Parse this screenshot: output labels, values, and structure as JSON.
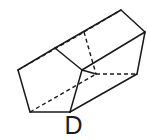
{
  "figure": {
    "label": "D",
    "shape_name": "pentagonal-prism",
    "projection": "oblique",
    "line_color": "#1a1a1a",
    "fill_color": "#ffffff",
    "background_color": "#ffffff",
    "geometry": {
      "front_pentagon": [
        [
          18,
          70
        ],
        [
          55,
          48
        ],
        [
          82,
          70
        ],
        [
          70,
          112
        ],
        [
          30,
          112
        ]
      ],
      "back_pentagon": [
        [
          84,
          32
        ],
        [
          121,
          10
        ],
        [
          145,
          32
        ],
        [
          137,
          74
        ],
        [
          96,
          74
        ]
      ],
      "visible_edges": [
        [
          [
            18,
            70
          ],
          [
            55,
            48
          ]
        ],
        [
          [
            18,
            70
          ],
          [
            30,
            112
          ]
        ],
        [
          [
            30,
            112
          ],
          [
            70,
            112
          ]
        ],
        [
          [
            70,
            112
          ],
          [
            82,
            70
          ]
        ],
        [
          [
            55,
            48
          ],
          [
            82,
            70
          ]
        ],
        [
          [
            55,
            48
          ],
          [
            121,
            10
          ]
        ],
        [
          [
            121,
            10
          ],
          [
            145,
            32
          ]
        ],
        [
          [
            145,
            32
          ],
          [
            137,
            74
          ]
        ],
        [
          [
            137,
            74
          ],
          [
            70,
            112
          ]
        ],
        [
          [
            82,
            70
          ],
          [
            96,
            74
          ]
        ],
        [
          [
            96,
            74
          ],
          [
            137,
            74
          ]
        ]
      ],
      "hidden_edges": [
        [
          [
            18,
            70
          ],
          [
            84,
            32
          ]
        ],
        [
          [
            84,
            32
          ],
          [
            121,
            10
          ]
        ],
        [
          [
            84,
            32
          ],
          [
            96,
            74
          ]
        ],
        [
          [
            30,
            112
          ],
          [
            96,
            74
          ]
        ],
        [
          [
            96,
            74
          ],
          [
            137,
            74
          ]
        ]
      ]
    }
  }
}
